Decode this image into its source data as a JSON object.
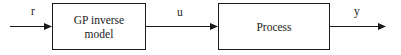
{
  "diagram": {
    "type": "block-diagram",
    "blocks": [
      {
        "id": "gp_inverse_model",
        "label": "GP inverse model",
        "lines": [
          "GP inverse",
          "model"
        ]
      },
      {
        "id": "process",
        "label": "Process",
        "lines": [
          "Process"
        ]
      }
    ],
    "signals": [
      {
        "id": "r",
        "label": "r",
        "from": "input",
        "to": "gp_inverse_model"
      },
      {
        "id": "u",
        "label": "u",
        "from": "gp_inverse_model",
        "to": "process"
      },
      {
        "id": "y",
        "label": "y",
        "from": "process",
        "to": "output"
      }
    ],
    "colors": {
      "stroke": "#1a1a1a",
      "background": "#ffffff"
    }
  }
}
